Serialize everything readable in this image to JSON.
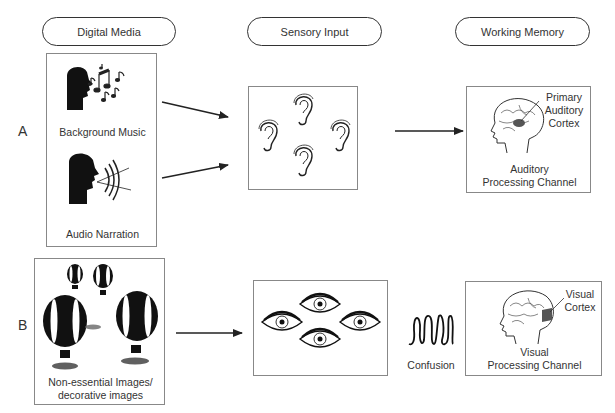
{
  "headers": {
    "digital_media": "Digital Media",
    "sensory_input": "Sensory Input",
    "working_memory": "Working Memory"
  },
  "rows": {
    "a": {
      "label": "A",
      "media_items": [
        "Background Music",
        "Audio Narration"
      ],
      "media_icons": [
        "music-singing-head-icon",
        "speaking-head-icon"
      ],
      "sensory_icon": "ear-icon",
      "sensory_count": 4,
      "memory": {
        "annotation_line1": "Primary",
        "annotation_line2": "Auditory",
        "annotation_line3": "Cortex",
        "channel_line1": "Auditory",
        "channel_line2": "Processing Channel"
      }
    },
    "b": {
      "label": "B",
      "media_caption_line1": "Non-essential Images/",
      "media_caption_line2": "decorative images",
      "media_icon": "hot-air-balloon-icon",
      "sensory_icon": "eye-icon",
      "sensory_count": 4,
      "confusion_label": "Confusion",
      "memory": {
        "annotation_line1": "Visual",
        "annotation_line2": "Cortex",
        "channel_line1": "Visual",
        "channel_line2": "Processing Channel"
      }
    }
  },
  "colors": {
    "stroke": "#222222",
    "box_border": "#888888",
    "cortex_fill": "#555555"
  }
}
